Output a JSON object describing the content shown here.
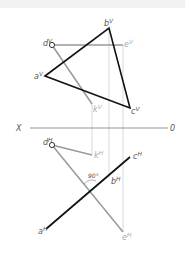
{
  "diagram": {
    "type": "descriptive-geometry-projection",
    "axis": {
      "left_label": "X",
      "right_label": "0"
    },
    "front_view": {
      "points": {
        "a": {
          "label": "a",
          "sup": "V"
        },
        "b": {
          "label": "b",
          "sup": "V"
        },
        "c": {
          "label": "c",
          "sup": "V"
        },
        "d": {
          "label": "d",
          "sup": "V"
        },
        "e": {
          "label": "e",
          "sup": "V"
        },
        "k": {
          "label": "k",
          "sup": "V"
        }
      }
    },
    "top_view": {
      "points": {
        "a": {
          "label": "a",
          "sup": "H"
        },
        "b": {
          "label": "b",
          "sup": "H"
        },
        "c": {
          "label": "c",
          "sup": "H"
        },
        "d": {
          "label": "d",
          "sup": "H"
        },
        "e": {
          "label": "e",
          "sup": "H"
        },
        "k": {
          "label": "k",
          "sup": "H"
        }
      },
      "angle_label": "90°"
    },
    "colors": {
      "triangle": "#111111",
      "line_de": "#999999",
      "projection": "#cccccc",
      "axis": "#888888"
    }
  }
}
